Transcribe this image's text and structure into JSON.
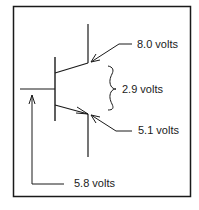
{
  "diagram": {
    "type": "transistor-voltage-diagram",
    "colors": {
      "line": "#1a1a1a",
      "background": "#ffffff"
    },
    "labels": {
      "collector_voltage": "8.0 volts",
      "collector_emitter_difference": "2.9 volts",
      "emitter_voltage": "5.1 volts",
      "base_voltage": "5.8 volts"
    }
  }
}
